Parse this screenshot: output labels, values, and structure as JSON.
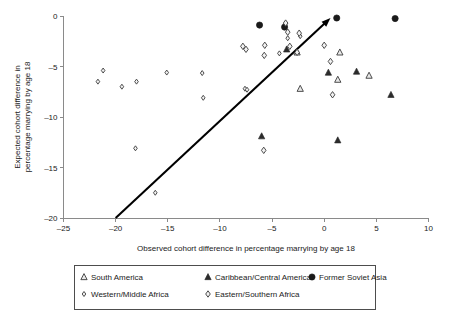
{
  "chart_data": {
    "type": "scatter",
    "title": "",
    "xlabel": "Observed cohort difference in percentage marrying by age 18",
    "ylabel": "Expected cohort difference in percentage marrying by age 18",
    "xlim": [
      -25,
      10
    ],
    "ylim": [
      -20,
      0
    ],
    "xticks": [
      -25,
      -20,
      -15,
      -10,
      -5,
      0,
      5,
      10
    ],
    "xtick_labels": [
      "–25",
      "–20",
      "–15",
      "–10",
      "–5",
      "0",
      "5",
      "10"
    ],
    "yticks": [
      0,
      -5,
      -10,
      -15,
      -20
    ],
    "ytick_labels": [
      "0",
      "–5",
      "–10",
      "–15",
      "–20"
    ],
    "grid": false,
    "legend_position": "bottom",
    "reference_line": {
      "label": "identity-trend-line",
      "x0": -20.0,
      "y0": -20.0,
      "x1": 0.6,
      "y1": -0.2,
      "arrow": "end"
    },
    "series": [
      {
        "name": "South America",
        "marker": "open-triangle",
        "points": [
          [
            -2.6,
            -3.6
          ],
          [
            -2.3,
            -7.2
          ],
          [
            1.5,
            -3.6
          ],
          [
            1.3,
            -6.3
          ],
          [
            4.3,
            -5.9
          ]
        ]
      },
      {
        "name": "Caribbean/Central America",
        "marker": "filled-triangle",
        "points": [
          [
            -3.6,
            -3.3
          ],
          [
            -6.0,
            -11.9
          ],
          [
            0.4,
            -5.6
          ],
          [
            1.3,
            -12.3
          ],
          [
            3.1,
            -5.5
          ],
          [
            6.4,
            -7.8
          ]
        ]
      },
      {
        "name": "Former Soviet Asia",
        "marker": "filled-circle",
        "points": [
          [
            -6.2,
            -0.9
          ],
          [
            -3.8,
            -1.1
          ],
          [
            1.2,
            -0.2
          ],
          [
            6.8,
            -0.25
          ]
        ]
      },
      {
        "name": "Western/Middle Africa",
        "marker": "open-diamond-small",
        "points": [
          [
            -21.7,
            -6.5
          ],
          [
            -21.2,
            -5.4
          ],
          [
            -19.4,
            -7.0
          ],
          [
            -18.0,
            -6.5
          ],
          [
            -18.1,
            -13.1
          ],
          [
            -16.2,
            -17.5
          ],
          [
            -15.1,
            -5.6
          ],
          [
            -11.7,
            -5.65
          ],
          [
            -11.6,
            -8.1
          ],
          [
            -7.6,
            -7.2
          ],
          [
            -7.4,
            -7.3
          ],
          [
            -4.3,
            -3.7
          ],
          [
            -3.7,
            -0.75
          ],
          [
            -3.5,
            -2.2
          ],
          [
            -2.3,
            -2.0
          ]
        ]
      },
      {
        "name": "Eastern/Southern Africa",
        "marker": "open-diamond",
        "points": [
          [
            -7.8,
            -3.0
          ],
          [
            -7.5,
            -3.3
          ],
          [
            -5.7,
            -2.9
          ],
          [
            -5.75,
            -3.9
          ],
          [
            -3.7,
            -0.7
          ],
          [
            -3.5,
            -1.6
          ],
          [
            -2.4,
            -1.7
          ],
          [
            -2.6,
            -3.6
          ],
          [
            -3.3,
            -3.0
          ],
          [
            -5.8,
            -13.3
          ],
          [
            0.0,
            -2.9
          ],
          [
            0.6,
            -4.5
          ],
          [
            0.8,
            -7.8
          ]
        ]
      }
    ]
  },
  "legend": {
    "entries": [
      {
        "label": "South America",
        "marker": "open-triangle"
      },
      {
        "label": "Caribbean/Central America",
        "marker": "filled-triangle"
      },
      {
        "label": "Former Soviet Asia",
        "marker": "filled-circle"
      },
      {
        "label": "Western/Middle Africa",
        "marker": "open-diamond-small"
      },
      {
        "label": "Eastern/Southern Africa",
        "marker": "open-diamond"
      }
    ]
  },
  "ylabel_lines": [
    "Expected cohort difference in",
    "percentage marrying by age 18"
  ]
}
